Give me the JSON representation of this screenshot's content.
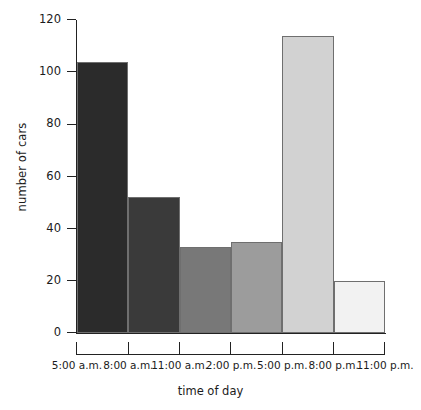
{
  "chart_data": {
    "type": "bar",
    "title": "",
    "subtitle": "",
    "xlabel": "time of day",
    "ylabel": "number of cars",
    "categories": [
      "5:00 a.m. - 8:00 a.m.",
      "8:00 a.m. - 11:00 a.m.",
      "11:00 a.m. - 2:00 p.m.",
      "2:00 p.m. - 5:00 p.m.",
      "5:00 p.m. - 8:00 p.m.",
      "8:00 p.m. - 11:00 p.m."
    ],
    "values": [
      104,
      52,
      33,
      35,
      114,
      20
    ],
    "bar_colors": [
      "#2b2b2b",
      "#3a3a3a",
      "#787878",
      "#9c9c9c",
      "#d2d2d2",
      "#f2f2f2"
    ],
    "bar_edge_color": "#6f6f6f",
    "ylim": [
      0,
      120
    ],
    "ytick_values": [
      0,
      20,
      40,
      60,
      80,
      100,
      120
    ],
    "ytick_labels": [
      "0",
      "20",
      "40",
      "60",
      "80",
      "100",
      "120"
    ],
    "xtick_labels": [
      "5:00 a.m.",
      "8:00 a.m.",
      "11:00 a.m.",
      "2:00 p.m.",
      "5:00 p.m.",
      "8:00 p.m.",
      "11:00 p.m."
    ],
    "grid": false,
    "legend": false,
    "legend_position": "none",
    "axis_color": "#222222",
    "background_color": "#ffffff"
  }
}
